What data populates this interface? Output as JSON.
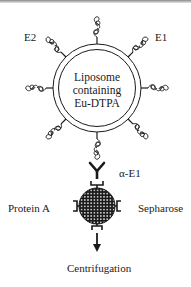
{
  "diagram": {
    "liposome": {
      "label_lines": [
        "Liposome",
        "containing",
        "Eu-DTPA"
      ]
    },
    "labels": {
      "e2": "E2",
      "e1": "E1",
      "antibody": "α-E1",
      "protein_a": "Protein A",
      "sepharose": "Sepharose",
      "centrifugation": "Centrifugation"
    },
    "colors": {
      "ink": "#1a1a1a",
      "background": "#ffffff"
    }
  }
}
